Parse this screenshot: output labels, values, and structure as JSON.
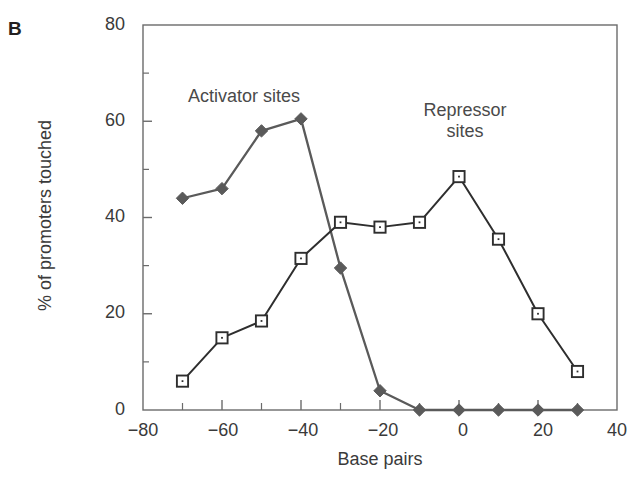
{
  "figure": {
    "panel_label": "B",
    "background_color": "#ffffff"
  },
  "chart_data": {
    "type": "line",
    "title": "",
    "panel": "B",
    "xlabel": "Base pairs",
    "ylabel": "% of promoters touched",
    "xlim": [
      -80,
      40
    ],
    "ylim": [
      0,
      80
    ],
    "xticks": [
      -80,
      -60,
      -40,
      -20,
      0,
      20,
      40
    ],
    "xtick_labels": [
      "−80",
      "−60",
      "−40",
      "−20",
      "0",
      "20",
      "40"
    ],
    "xminor_ticks": [
      -70,
      -50,
      -30,
      -10,
      10,
      30
    ],
    "yticks": [
      0,
      20,
      40,
      60,
      80
    ],
    "ytick_labels": [
      "0",
      "20",
      "40",
      "60",
      "80"
    ],
    "yminor_ticks": [
      10,
      30,
      50,
      70
    ],
    "grid": false,
    "legend": "annotations-on-plot",
    "series": [
      {
        "name": "Activator sites",
        "marker": "filled-diamond",
        "color": "#5a5a5a",
        "annotation_position": "upper-left",
        "x": [
          -70,
          -60,
          -50,
          -40,
          -30,
          -20,
          -10,
          0,
          10,
          20,
          30
        ],
        "values": [
          44,
          46,
          58,
          60.5,
          29.5,
          4,
          0,
          0,
          0,
          0,
          0
        ]
      },
      {
        "name": "Repressor sites",
        "marker": "open-square",
        "color": "#2e2e2e",
        "annotation_position": "upper-right",
        "x": [
          -70,
          -60,
          -50,
          -40,
          -30,
          -20,
          -10,
          0,
          10,
          20,
          30
        ],
        "values": [
          6,
          15,
          18.5,
          31.5,
          39,
          38,
          39,
          48.5,
          35.5,
          20,
          8
        ]
      }
    ],
    "annotations": [
      {
        "text": "Activator sites",
        "x": -53,
        "y": 66
      },
      {
        "text": "Repressor sites",
        "x": 2,
        "y": 64
      }
    ]
  }
}
